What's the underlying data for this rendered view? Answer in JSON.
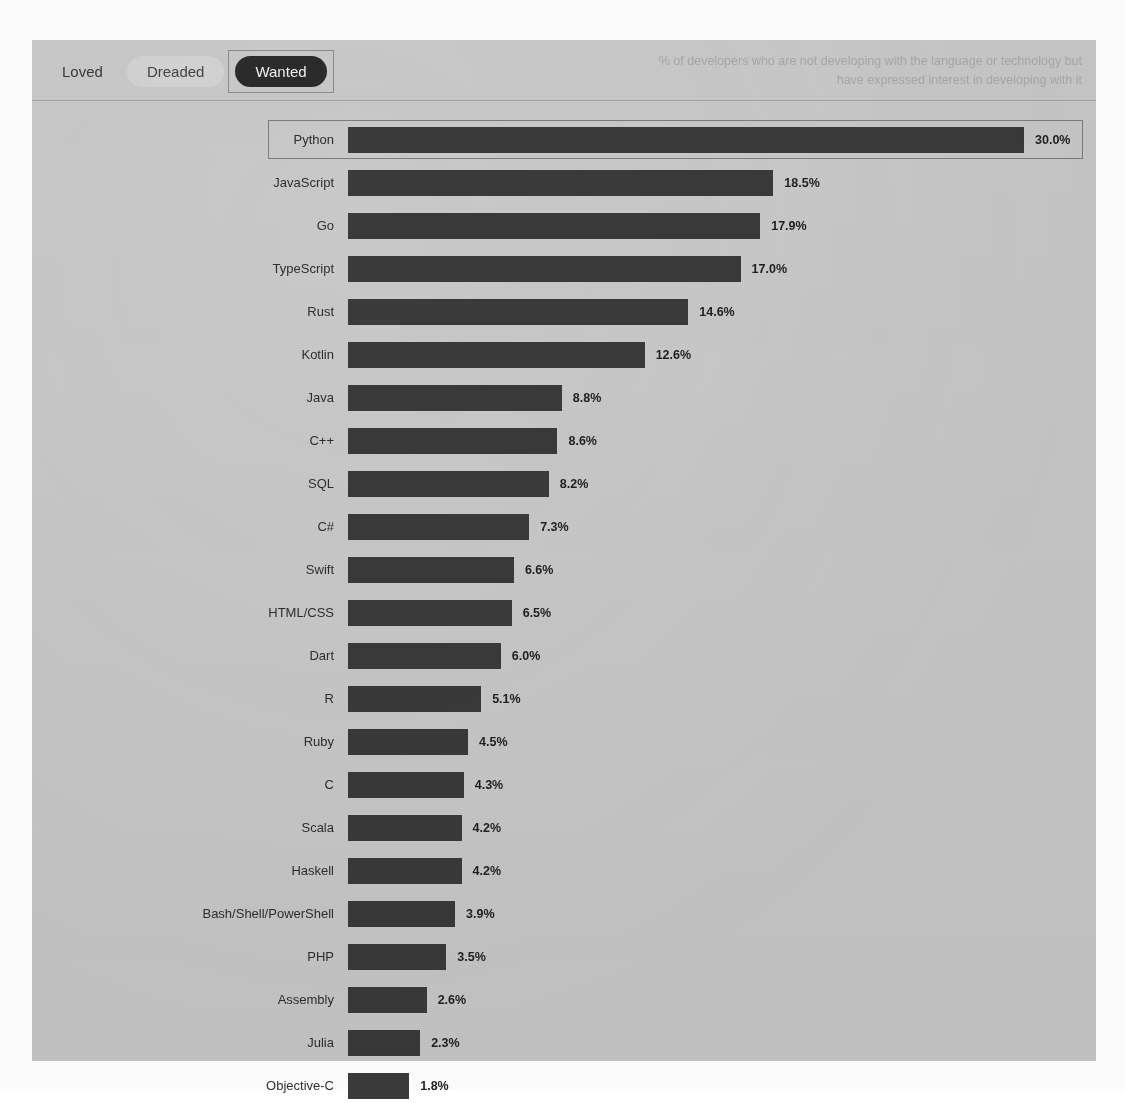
{
  "header": {
    "toggles": [
      {
        "label": "Loved",
        "state": "inactive"
      },
      {
        "label": "Dreaded",
        "state": "soft"
      },
      {
        "label": "Wanted",
        "state": "active"
      }
    ],
    "caption": "% of developers who are not developing with the language or technology but have expressed interest in developing with it"
  },
  "colors": {
    "panel_background": "#c9c9c9",
    "bar": "#3a3a3a",
    "active_pill": "#2b2b2b",
    "active_pill_text": "#f2f2f2",
    "soft_pill": "#d3d3d3",
    "caption_text": "#a9a9a9",
    "highlight_border": "#7c7c7c"
  },
  "chart_data": {
    "type": "bar",
    "orientation": "horizontal",
    "title": "",
    "subtitle": "",
    "xlabel": "",
    "ylabel": "",
    "grid": false,
    "legend": false,
    "xlim": [
      0,
      30
    ],
    "value_suffix": "%",
    "highlighted_category": "Python",
    "categories": [
      "Python",
      "JavaScript",
      "Go",
      "TypeScript",
      "Rust",
      "Kotlin",
      "Java",
      "C++",
      "SQL",
      "C#",
      "Swift",
      "HTML/CSS",
      "Dart",
      "R",
      "Ruby",
      "C",
      "Scala",
      "Haskell",
      "Bash/Shell/PowerShell",
      "PHP",
      "Assembly",
      "Julia",
      "Objective-C"
    ],
    "values": [
      30.0,
      18.5,
      17.9,
      17.0,
      14.6,
      12.6,
      8.8,
      8.6,
      8.2,
      7.3,
      6.6,
      6.5,
      6.0,
      5.1,
      4.5,
      4.3,
      4.2,
      4.2,
      3.9,
      3.5,
      2.6,
      2.3,
      1.8
    ],
    "value_labels": [
      "30.0%",
      "18.5%",
      "17.9%",
      "17.0%",
      "14.6%",
      "12.6%",
      "8.8%",
      "8.6%",
      "8.2%",
      "7.3%",
      "6.6%",
      "6.5%",
      "6.0%",
      "5.1%",
      "4.5%",
      "4.3%",
      "4.2%",
      "4.2%",
      "3.9%",
      "3.5%",
      "2.6%",
      "2.3%",
      "1.8%"
    ]
  }
}
